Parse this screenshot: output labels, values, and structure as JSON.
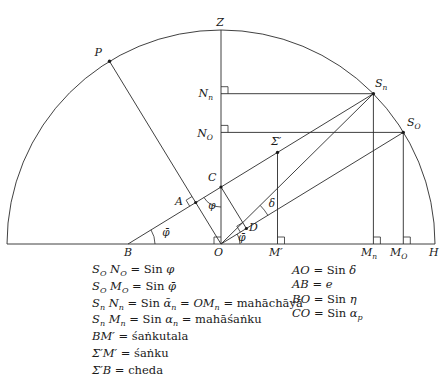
{
  "colors": {
    "line": "#2b2b2b",
    "text": "#1a1a1a",
    "background": "#ffffff"
  },
  "labels": {
    "Z": {
      "t": "Z"
    },
    "P": {
      "t": "P"
    },
    "Sn": {
      "t": "S",
      "sub": "n"
    },
    "SO": {
      "t": "S",
      "sub": "O"
    },
    "Nn": {
      "t": "N",
      "sub": "n"
    },
    "NO": {
      "t": "N",
      "sub": "O"
    },
    "Sigma": {
      "t": "Σ′"
    },
    "C": {
      "t": "C"
    },
    "A": {
      "t": "A"
    },
    "B": {
      "t": "B"
    },
    "O": {
      "t": "O"
    },
    "D": {
      "t": "D"
    },
    "Mp": {
      "t": "M′"
    },
    "Mn": {
      "t": "M",
      "sub": "n"
    },
    "MO": {
      "t": "M",
      "sub": "O"
    },
    "H": {
      "t": "H"
    }
  },
  "angles": {
    "at_B": "φ̄",
    "at_C": "φ",
    "at_O": "φ̄",
    "delta": "δ"
  },
  "legend": {
    "left": [
      {
        "p": [
          "S",
          "O",
          " N",
          "O",
          " = Sin ",
          "φ"
        ]
      },
      {
        "p": [
          "S",
          "O",
          " M",
          "O",
          " = Sin ",
          "φ̄"
        ]
      },
      {
        "p": [
          "S",
          "n",
          " N",
          "n",
          " = Sin ",
          "ᾱ",
          "n",
          " = ",
          "OM",
          "n",
          " = mahāchāyā"
        ]
      },
      {
        "p": [
          "S",
          "n",
          " M",
          "n",
          " = Sin ",
          "α",
          "n",
          " = mahāśaṅku"
        ]
      },
      {
        "p": [
          "BM′",
          " = śaṅkutala"
        ]
      },
      {
        "p": [
          "Σ′M′",
          " = śaṅku"
        ]
      },
      {
        "p": [
          "Σ′B",
          " = cheda"
        ]
      }
    ],
    "right": [
      {
        "p": [
          "AO",
          " = Sin ",
          "δ"
        ]
      },
      {
        "p": [
          "AB",
          " = ",
          "e"
        ]
      },
      {
        "p": [
          "BO",
          " = Sin ",
          "η"
        ]
      },
      {
        "p": [
          "CO",
          " = Sin ",
          "α",
          "p"
        ]
      }
    ]
  }
}
